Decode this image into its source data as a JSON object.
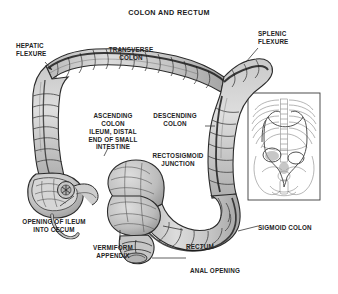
{
  "figure": {
    "title": "COLON AND RECTUM",
    "width": 338,
    "height": 294,
    "background_color": "#ffffff",
    "ink_color": "#232323",
    "organ_fill_color": "#cfcfcf",
    "organ_shade_color": "#a8a8a8"
  },
  "labels": {
    "hepatic_flexure": "HEPATIC\nFLEXURE",
    "transverse_colon": "TRANSVERSE\nCOLON",
    "splenic_flexure": "SPLENIC\nFLEXURE",
    "ascending_colon": "ASCENDING\nCOLON",
    "descending_colon": "DESCENDING\nCOLON",
    "ileum_distal": "ILEUM, DISTAL\nEND OF SMALL\nINTESTINE",
    "rectosigmoid_junction": "RECTOSIGMOID\nJUNCTION",
    "opening_of_ileum": "OPENING OF ILEUM\nINTO CECUM",
    "vermiform_appendix": "VERMIFORM\nAPPENDIX",
    "sigmoid_colon": "SIGMOID COLON",
    "rectum": "RECTUM",
    "anal_opening": "ANAL OPENING"
  },
  "inset": {
    "description": "torso-orientation-inset",
    "contents": [
      "ribcage",
      "spine",
      "pelvis",
      "colon-outline"
    ]
  }
}
